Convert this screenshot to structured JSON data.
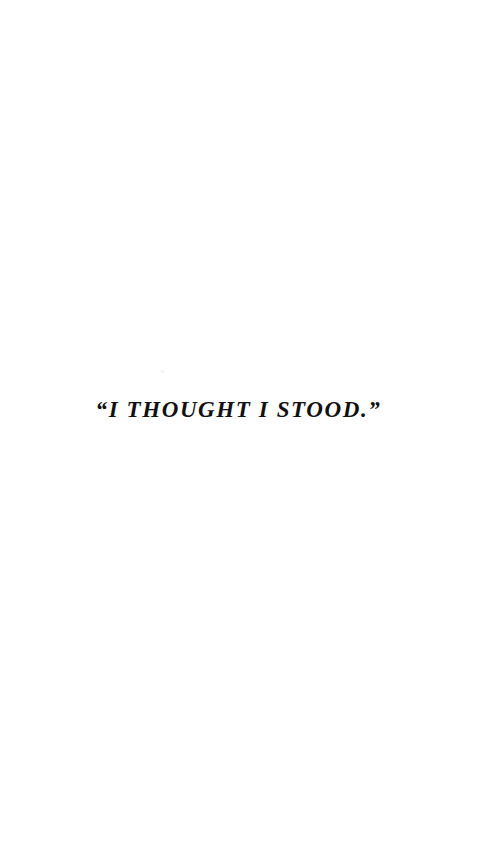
{
  "page": {
    "background_color": "#ffffff",
    "text_color": "#111111",
    "width": 501,
    "height": 848
  },
  "caption": {
    "text": "“I THOUGHT I STOOD.”",
    "plain_text": "“I THOUGHT I STOOD.”",
    "quoted_phrase": "I THOUGHT I STOOD.",
    "open_quote": "“",
    "close_quote": "”",
    "style": "italic small-caps serif, letterspaced",
    "alignment": "center"
  },
  "artifacts": {
    "speck_label": ""
  }
}
